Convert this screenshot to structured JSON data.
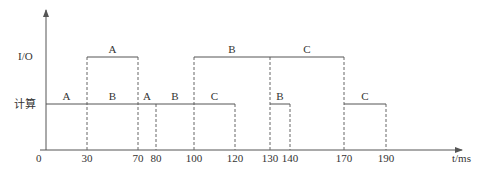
{
  "diagram": {
    "title": "",
    "colors": {
      "line": "#555555",
      "text": "#333333",
      "dash": "#666666",
      "background": "#ffffff"
    },
    "axes": {
      "origin_label": "0",
      "x_unit_label": "t/ms",
      "row_labels": {
        "io": "I/O",
        "compute": "计算"
      }
    },
    "ticks": [
      {
        "value": 30,
        "label": "30",
        "x": 87
      },
      {
        "value": 70,
        "label": "70",
        "x": 138
      },
      {
        "value": 80,
        "label": "80",
        "x": 156
      },
      {
        "value": 100,
        "label": "100",
        "x": 194
      },
      {
        "value": 120,
        "label": "120",
        "x": 235
      },
      {
        "value": 130,
        "label": "130",
        "x": 270
      },
      {
        "value": 140,
        "label": "140",
        "x": 290
      },
      {
        "value": 170,
        "label": "170",
        "x": 344
      },
      {
        "value": 190,
        "label": "190",
        "x": 386
      }
    ],
    "io_segments": [
      {
        "label": "A",
        "start": 30,
        "end": 70
      },
      {
        "label": "B",
        "start": 100,
        "end": 130
      },
      {
        "label": "C",
        "start": 130,
        "end": 170
      }
    ],
    "compute_segments": [
      {
        "label": "A",
        "start": 0,
        "end": 30
      },
      {
        "label": "B",
        "start": 30,
        "end": 70
      },
      {
        "label": "A",
        "start": 70,
        "end": 80
      },
      {
        "label": "B",
        "start": 80,
        "end": 100
      },
      {
        "label": "C",
        "start": 100,
        "end": 120
      },
      {
        "label": "B",
        "start": 130,
        "end": 140
      },
      {
        "label": "C",
        "start": 170,
        "end": 190
      }
    ]
  }
}
